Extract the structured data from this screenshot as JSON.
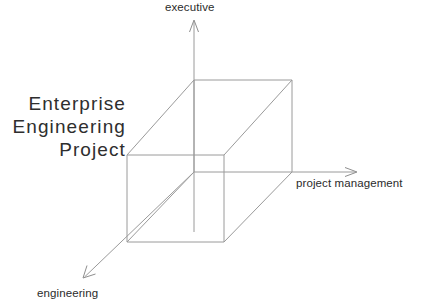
{
  "diagram": {
    "title_lines": [
      "Enterprise",
      "Engineering",
      "Project"
    ],
    "axes": [
      {
        "id": "executive",
        "label": "executive",
        "direction": "up",
        "arrow_tip": [
          194,
          20
        ],
        "arrow_base": [
          194,
          80
        ]
      },
      {
        "id": "project-management",
        "label": "project management",
        "direction": "right",
        "arrow_tip": [
          357,
          172
        ],
        "arrow_base": [
          292,
          172
        ]
      },
      {
        "id": "engineering",
        "label": "engineering",
        "direction": "down-left",
        "arrow_tip": [
          83,
          278
        ],
        "arrow_base": [
          194,
          172
        ]
      }
    ],
    "cube": {
      "front_face": [
        [
          127,
          155
        ],
        [
          224,
          155
        ],
        [
          224,
          242
        ],
        [
          127,
          242
        ]
      ],
      "back_face": [
        [
          194,
          80
        ],
        [
          292,
          80
        ],
        [
          292,
          172
        ],
        [
          194,
          172
        ]
      ],
      "connectors": [
        [
          [
            127,
            155
          ],
          [
            194,
            80
          ]
        ],
        [
          [
            224,
            155
          ],
          [
            292,
            80
          ]
        ],
        [
          [
            224,
            242
          ],
          [
            292,
            172
          ]
        ],
        [
          [
            127,
            242
          ],
          [
            194,
            172
          ]
        ]
      ]
    },
    "colors": {
      "line": "#9a9a9a",
      "axis": "#8e8e8e",
      "text": "#2e2e2e",
      "background": "#ffffff"
    }
  }
}
